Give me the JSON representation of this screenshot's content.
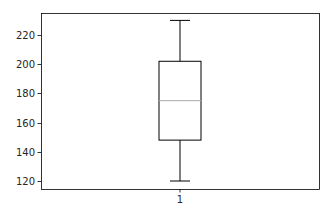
{
  "chart_data": {
    "type": "box",
    "title": "",
    "xlabel": "",
    "ylabel": "",
    "categories": [
      "1"
    ],
    "series": [
      {
        "name": "1",
        "whisker_low": 120,
        "q1": 148,
        "median": 175,
        "q3": 202,
        "whisker_high": 230,
        "outliers": []
      }
    ],
    "ylim": [
      115,
      235
    ],
    "yticks": [
      120,
      140,
      160,
      180,
      200,
      220
    ],
    "xticks": [
      "1"
    ],
    "grid": false,
    "legend": null
  },
  "style": {
    "box_color": "#000000",
    "median_color": "#aaaaaa",
    "axis_color": "#000000"
  }
}
